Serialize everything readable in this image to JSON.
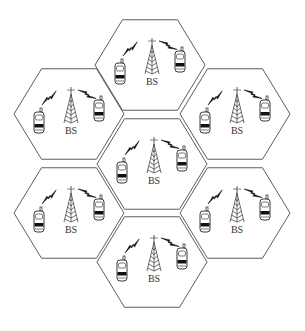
{
  "diagram": {
    "type": "cellular-network-hexagonal-cells",
    "line_color": "#4a4a4a",
    "hex_radius": 55,
    "cells": [
      {
        "id": "top",
        "cx": 150,
        "cy": 65,
        "label": "BS"
      },
      {
        "id": "upper-left",
        "cx": 69,
        "cy": 114,
        "label": "BS"
      },
      {
        "id": "upper-right",
        "cx": 235,
        "cy": 114,
        "label": "BS"
      },
      {
        "id": "center",
        "cx": 152,
        "cy": 164,
        "label": "BS"
      },
      {
        "id": "lower-left",
        "cx": 69,
        "cy": 213,
        "label": "BS"
      },
      {
        "id": "lower-right",
        "cx": 235,
        "cy": 213,
        "label": "BS"
      },
      {
        "id": "bottom",
        "cx": 152,
        "cy": 262,
        "label": "BS"
      }
    ],
    "cell_contents": {
      "base_station_icon": "tower-icon",
      "mobile_icon": "mobile-phone-icon",
      "link_icon": "lightning-bolt-icon",
      "mobiles_per_cell": 2
    }
  }
}
